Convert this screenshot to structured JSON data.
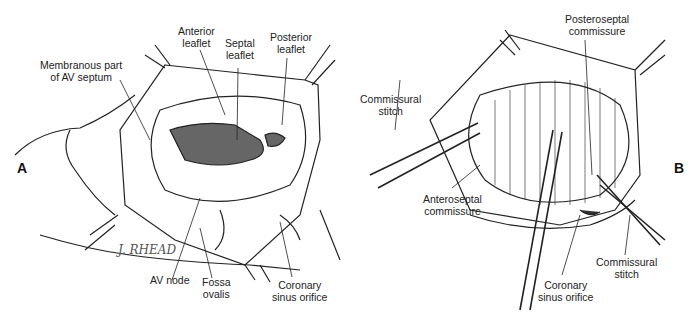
{
  "figure": {
    "panel_a": {
      "letter": "A",
      "labels": {
        "membranous": [
          "Membranous part",
          "of AV septum"
        ],
        "anterior": [
          "Anterior",
          "leaflet"
        ],
        "septal": [
          "Septal",
          "leaflet"
        ],
        "posterior": [
          "Posterior",
          "leaflet"
        ],
        "av_node": [
          "AV node"
        ],
        "fossa": [
          "Fossa",
          "ovalis"
        ],
        "coronary": [
          "Coronary",
          "sinus orifice"
        ]
      },
      "signature": "J. RHEAD"
    },
    "panel_b": {
      "letter": "B",
      "labels": {
        "posteroseptal": [
          "Posteroseptal",
          "commissure"
        ],
        "stitch_left": [
          "Commissural",
          "stitch"
        ],
        "anteroseptal": [
          "Anteroseptal",
          "commissure"
        ],
        "coronary": [
          "Coronary",
          "sinus orifice"
        ],
        "stitch_right": [
          "Commissural",
          "stitch"
        ]
      }
    }
  }
}
